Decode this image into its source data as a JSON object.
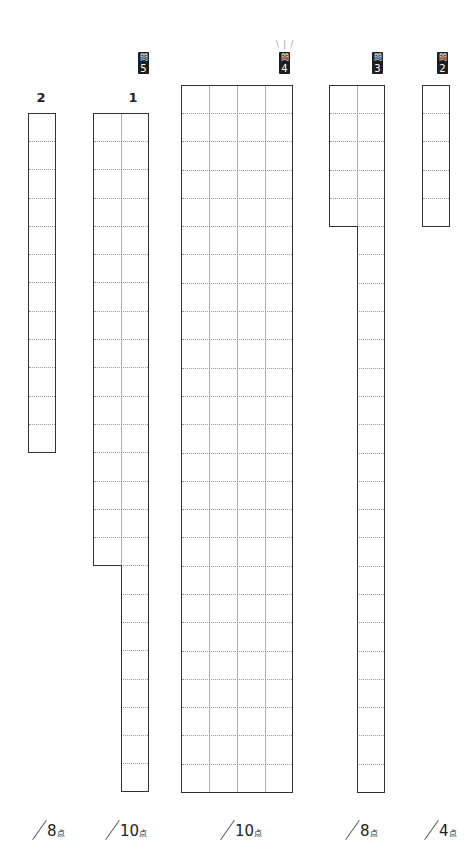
{
  "questions": [
    {
      "id": "q5",
      "badge_kanji": "問",
      "badge_num": "5",
      "sub_labels": [
        "2",
        "1"
      ]
    },
    {
      "id": "q4",
      "badge_kanji": "問",
      "badge_num": "4",
      "sparkle": "\\ | /"
    },
    {
      "id": "q3",
      "badge_kanji": "問",
      "badge_num": "3"
    },
    {
      "id": "q2",
      "badge_kanji": "問",
      "badge_num": "2"
    }
  ],
  "scores": [
    {
      "points": "8",
      "unit": "点"
    },
    {
      "points": "10",
      "unit": "点"
    },
    {
      "points": "10",
      "unit": "点"
    },
    {
      "points": "8",
      "unit": "点"
    },
    {
      "points": "4",
      "unit": "点"
    }
  ],
  "grids": {
    "q5_2": {
      "columns": 1,
      "rows": 12
    },
    "q5_1": {
      "columns": 2,
      "rows_left": 16,
      "rows_right": 24
    },
    "q4": {
      "columns": 4,
      "rows": 25
    },
    "q3": {
      "columns": 2,
      "rows_left": 5,
      "rows_right": 25
    },
    "q2": {
      "columns": 1,
      "rows": 5
    }
  }
}
